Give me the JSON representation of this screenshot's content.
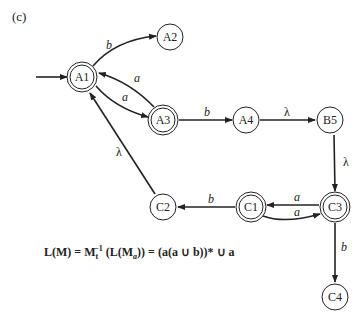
{
  "figure": {
    "part_label": "(c)"
  },
  "nodes": [
    {
      "id": "A1",
      "label": "A1",
      "x": 82,
      "y": 77,
      "accepting": true,
      "start": true
    },
    {
      "id": "A2",
      "label": "A2",
      "x": 170,
      "y": 37,
      "accepting": false
    },
    {
      "id": "A3",
      "label": "A3",
      "x": 163,
      "y": 120,
      "accepting": true
    },
    {
      "id": "A4",
      "label": "A4",
      "x": 246,
      "y": 120,
      "accepting": false
    },
    {
      "id": "B5",
      "label": "B5",
      "x": 330,
      "y": 120,
      "accepting": false
    },
    {
      "id": "C3",
      "label": "C3",
      "x": 335,
      "y": 207,
      "accepting": true
    },
    {
      "id": "C1",
      "label": "C1",
      "x": 251,
      "y": 207,
      "accepting": true
    },
    {
      "id": "C2",
      "label": "C2",
      "x": 163,
      "y": 207,
      "accepting": false
    },
    {
      "id": "C4",
      "label": "C4",
      "x": 335,
      "y": 297,
      "accepting": false
    }
  ],
  "edges": [
    {
      "from": "A1",
      "to": "A2",
      "label": "b"
    },
    {
      "from": "A3",
      "to": "A1",
      "label": "a"
    },
    {
      "from": "A1",
      "to": "A3",
      "label": "a"
    },
    {
      "from": "A3",
      "to": "A4",
      "label": "b"
    },
    {
      "from": "A4",
      "to": "B5",
      "label": "λ"
    },
    {
      "from": "B5",
      "to": "C3",
      "label": "λ"
    },
    {
      "from": "C3",
      "to": "C1",
      "label": "a"
    },
    {
      "from": "C1",
      "to": "C3",
      "label": "a"
    },
    {
      "from": "C1",
      "to": "C2",
      "label": "b"
    },
    {
      "from": "C2",
      "to": "A1",
      "label": "λ"
    },
    {
      "from": "C3",
      "to": "C4",
      "label": "b"
    }
  ],
  "formula": {
    "lhs": "L(M) = M",
    "m_sub": "t",
    "m_sup": "−1",
    "mid1": " (L(M",
    "ma_sub": "a",
    "rhs": ")) = (a(a ∪ b))* ∪ a"
  }
}
